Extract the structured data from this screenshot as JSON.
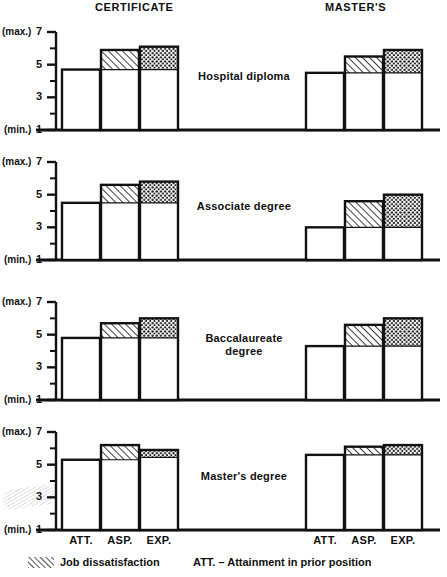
{
  "headers": {
    "left": "CERTIFICATE",
    "right": "MASTER'S"
  },
  "axis": {
    "max_label": "(max.)",
    "min_label": "(min.)",
    "tick_7": "7",
    "tick_5": "5",
    "tick_3": "3",
    "tick_1": "1"
  },
  "xticks": {
    "att": "ATT.",
    "asp": "ASP.",
    "exp": "EXP."
  },
  "panels": [
    {
      "caption_line1": "Hospital diploma",
      "caption_line2": ""
    },
    {
      "caption_line1": "Associate degree",
      "caption_line2": ""
    },
    {
      "caption_line1": "Baccalaureate",
      "caption_line2": "degree"
    },
    {
      "caption_line1": "Master's degree",
      "caption_line2": ""
    }
  ],
  "legend": {
    "hatch_label": "Job dissatisfaction",
    "att_label": "ATT. – Attainment in prior position"
  },
  "colors": {
    "ink": "#111111",
    "bar_fill": "#ffffff",
    "hatch": "#1a1a1a",
    "dot": "#1a1a1a"
  },
  "chart_data": {
    "type": "bar",
    "title": "",
    "subtitle": "",
    "xlabel": "",
    "ylabel": "",
    "ylim": [
      1,
      7
    ],
    "yticks": [
      1,
      2,
      3,
      4,
      5,
      6,
      7
    ],
    "ytick_labels": [
      "1",
      "",
      "3",
      "",
      "5",
      "",
      "7"
    ],
    "y_axis_note": "1 = (min.), 7 = (max.)",
    "grid": false,
    "legend_position": "bottom",
    "categories": [
      "ATT.",
      "ASP.",
      "EXP."
    ],
    "groups": [
      "CERTIFICATE",
      "MASTER'S"
    ],
    "panels": [
      {
        "name": "Hospital diploma",
        "series": [
          {
            "name": "CERTIFICATE",
            "bars": [
              {
                "category": "ATT.",
                "base": 1,
                "value": 4.7,
                "fill": "plain"
              },
              {
                "category": "ASP.",
                "base": 1,
                "value": 5.9,
                "fill": "plain",
                "overlay": {
                  "pattern": "hatch",
                  "from": 4.7,
                  "to": 5.9
                }
              },
              {
                "category": "EXP.",
                "base": 1,
                "value": 6.1,
                "fill": "plain",
                "overlay": {
                  "pattern": "dot",
                  "from": 4.7,
                  "to": 6.1
                }
              }
            ]
          },
          {
            "name": "MASTER'S",
            "bars": [
              {
                "category": "ATT.",
                "base": 1,
                "value": 4.5,
                "fill": "plain"
              },
              {
                "category": "ASP.",
                "base": 1,
                "value": 5.5,
                "fill": "plain",
                "overlay": {
                  "pattern": "hatch",
                  "from": 4.5,
                  "to": 5.5
                }
              },
              {
                "category": "EXP.",
                "base": 1,
                "value": 5.9,
                "fill": "plain",
                "overlay": {
                  "pattern": "dot",
                  "from": 4.5,
                  "to": 5.9
                }
              }
            ]
          }
        ]
      },
      {
        "name": "Associate degree",
        "series": [
          {
            "name": "CERTIFICATE",
            "bars": [
              {
                "category": "ATT.",
                "base": 1,
                "value": 4.5,
                "fill": "plain"
              },
              {
                "category": "ASP.",
                "base": 1,
                "value": 5.6,
                "fill": "plain",
                "overlay": {
                  "pattern": "hatch",
                  "from": 4.5,
                  "to": 5.6
                }
              },
              {
                "category": "EXP.",
                "base": 1,
                "value": 5.8,
                "fill": "plain",
                "overlay": {
                  "pattern": "dot",
                  "from": 4.5,
                  "to": 5.8
                }
              }
            ]
          },
          {
            "name": "MASTER'S",
            "bars": [
              {
                "category": "ATT.",
                "base": 1,
                "value": 3.0,
                "fill": "plain"
              },
              {
                "category": "ASP.",
                "base": 1,
                "value": 4.6,
                "fill": "plain",
                "overlay": {
                  "pattern": "hatch",
                  "from": 3.0,
                  "to": 4.6
                }
              },
              {
                "category": "EXP.",
                "base": 1,
                "value": 5.0,
                "fill": "plain",
                "overlay": {
                  "pattern": "dot",
                  "from": 3.0,
                  "to": 5.0
                }
              }
            ]
          }
        ]
      },
      {
        "name": "Baccalaureate degree",
        "series": [
          {
            "name": "CERTIFICATE",
            "bars": [
              {
                "category": "ATT.",
                "base": 1,
                "value": 4.8,
                "fill": "plain"
              },
              {
                "category": "ASP.",
                "base": 1,
                "value": 5.7,
                "fill": "plain",
                "overlay": {
                  "pattern": "hatch",
                  "from": 4.8,
                  "to": 5.7
                }
              },
              {
                "category": "EXP.",
                "base": 1,
                "value": 6.0,
                "fill": "plain",
                "overlay": {
                  "pattern": "dot",
                  "from": 4.8,
                  "to": 6.0
                }
              }
            ]
          },
          {
            "name": "MASTER'S",
            "bars": [
              {
                "category": "ATT.",
                "base": 1,
                "value": 4.3,
                "fill": "plain"
              },
              {
                "category": "ASP.",
                "base": 1,
                "value": 5.6,
                "fill": "plain",
                "overlay": {
                  "pattern": "hatch",
                  "from": 4.3,
                  "to": 5.6
                }
              },
              {
                "category": "EXP.",
                "base": 1,
                "value": 6.0,
                "fill": "plain",
                "overlay": {
                  "pattern": "dot",
                  "from": 4.3,
                  "to": 6.0
                }
              }
            ]
          }
        ]
      },
      {
        "name": "Master's degree",
        "series": [
          {
            "name": "CERTIFICATE",
            "bars": [
              {
                "category": "ATT.",
                "base": 1,
                "value": 5.3,
                "fill": "plain"
              },
              {
                "category": "ASP.",
                "base": 1,
                "value": 6.2,
                "fill": "plain",
                "overlay": {
                  "pattern": "hatch",
                  "from": 5.3,
                  "to": 6.2
                }
              },
              {
                "category": "EXP.",
                "base": 1,
                "value": 5.9,
                "fill": "plain",
                "overlay": {
                  "pattern": "dot",
                  "from": 5.45,
                  "to": 5.9
                }
              }
            ]
          },
          {
            "name": "MASTER'S",
            "bars": [
              {
                "category": "ATT.",
                "base": 1,
                "value": 5.6,
                "fill": "plain"
              },
              {
                "category": "ASP.",
                "base": 1,
                "value": 6.1,
                "fill": "plain",
                "overlay": {
                  "pattern": "hatch",
                  "from": 5.6,
                  "to": 6.1
                }
              },
              {
                "category": "EXP.",
                "base": 1,
                "value": 6.2,
                "fill": "plain",
                "overlay": {
                  "pattern": "dot",
                  "from": 5.6,
                  "to": 6.2
                }
              }
            ]
          }
        ]
      }
    ]
  }
}
